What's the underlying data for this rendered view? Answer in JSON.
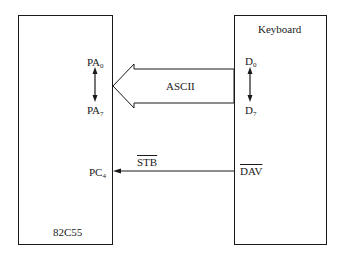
{
  "diagram": {
    "left_block": {
      "name": "82C55",
      "pins": {
        "pa_top": {
          "base": "PA",
          "sub": "0"
        },
        "pa_bottom": {
          "base": "PA",
          "sub": "7"
        },
        "pc": {
          "base": "PC",
          "sub": "4"
        }
      }
    },
    "right_block": {
      "name": "Keyboard",
      "pins": {
        "d_top": {
          "base": "D",
          "sub": "0"
        },
        "d_bottom": {
          "base": "D",
          "sub": "7"
        },
        "dav": "DAV"
      }
    },
    "connections": {
      "bus_label": "ASCII",
      "strobe_label": "STB"
    }
  }
}
